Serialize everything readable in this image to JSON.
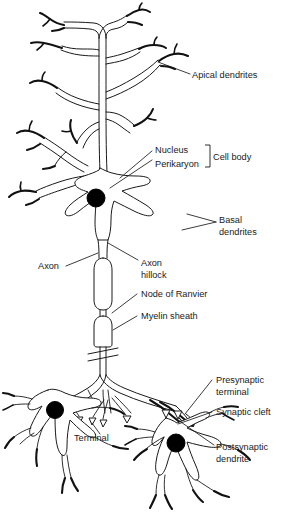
{
  "figure": {
    "background_color": "#ffffff",
    "line_color": "#1a1a1a",
    "nucleus_color": "#000000"
  },
  "labels": {
    "apical_dendrites": "Apical dendrites",
    "nucleus": "Nucleus",
    "perikaryon": "Perikaryon",
    "cell_body": "Cell body",
    "basal_1": "Basal",
    "basal_2": "dendrites",
    "axon": "Axon",
    "axon_hillock_1": "Axon",
    "axon_hillock_2": "hillock",
    "node_of_ranvier": "Node of Ranvier",
    "myelin_sheath": "Myelin sheath",
    "presynaptic_1": "Presynaptic",
    "presynaptic_2": "terminal",
    "synaptic_cleft": "Synaptic cleft",
    "postsynaptic_1": "Postsynaptic",
    "postsynaptic_2": "dendrite",
    "terminal": "Terminal"
  }
}
